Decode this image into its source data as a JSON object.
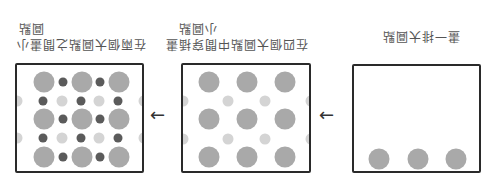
{
  "orientation": "rotated-180",
  "colors": {
    "big_dot": "#a9a9a9",
    "dark_dot": "#5b5b5b",
    "light_dot": "#d4d4d4",
    "border": "#2a2a2a"
  },
  "steps": [
    {
      "caption_line1": "畫一排大圓點",
      "caption_line2": ""
    },
    {
      "caption_line1": "在四個大圓點中間穿插畫",
      "caption_line2": "小圓點"
    },
    {
      "caption_line1": "在兩個大圓點之間畫小",
      "caption_line2": "圓點"
    }
  ],
  "arrows": {
    "glyph": "←"
  }
}
